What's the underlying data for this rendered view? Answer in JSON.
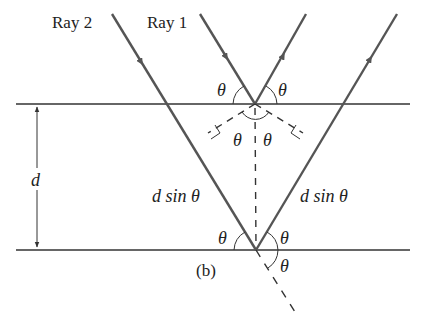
{
  "diagram": {
    "caption": "(b)",
    "labels": {
      "ray2": "Ray 2",
      "ray1": "Ray 1",
      "spacing": "d",
      "path_left": "d sin θ",
      "path_right": "d sin θ",
      "theta": "θ"
    },
    "theta_labels": {
      "top_left": "θ",
      "top_right": "θ",
      "top_inner_left": "θ",
      "top_inner_right": "θ",
      "bottom_left": "θ",
      "bottom_right": "θ",
      "bottom_lower": "θ"
    },
    "colors": {
      "plane_line": "#333333",
      "ray": "#555555",
      "dashed": "#333333",
      "text": "#222222"
    }
  }
}
